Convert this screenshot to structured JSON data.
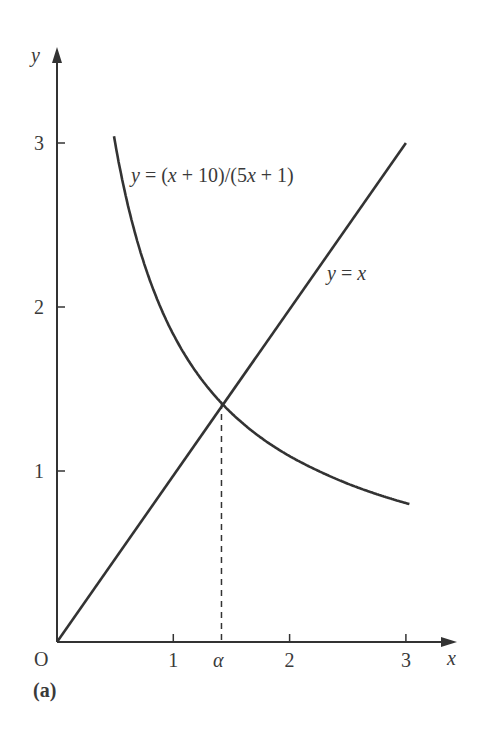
{
  "figure": {
    "panel_label": "(a)",
    "origin_label": "O",
    "x_axis_label": "x",
    "y_axis_label": "y",
    "alpha_label": "α",
    "curve_label": "y = (x + 10)/(5x + 1)",
    "line_label": "y = x"
  },
  "chart_data": {
    "type": "line",
    "title": "",
    "panel": "(a)",
    "xlabel": "x",
    "ylabel": "y",
    "xlim": [
      0,
      3.3
    ],
    "ylim": [
      0,
      3.4
    ],
    "x_ticks": [
      1,
      2,
      3
    ],
    "y_ticks": [
      1,
      2,
      3
    ],
    "grid": false,
    "legend": "none (curves labeled inline)",
    "series": [
      {
        "name": "y = (x + 10)/(5x + 1)",
        "function": "(x + 10)/(5x + 1)",
        "x": [
          0.49,
          0.6,
          0.8,
          1.0,
          1.2,
          1.414,
          1.6,
          1.8,
          2.0,
          2.2,
          2.4,
          2.6,
          2.8,
          3.0
        ],
        "values": [
          3.04,
          2.65,
          2.16,
          1.83,
          1.6,
          1.414,
          1.29,
          1.18,
          1.09,
          1.02,
          0.96,
          0.9,
          0.86,
          0.81
        ]
      },
      {
        "name": "y = x",
        "function": "x",
        "x": [
          0,
          3
        ],
        "values": [
          0,
          3
        ]
      }
    ],
    "annotations": [
      {
        "text": "α",
        "x": 1.414,
        "note": "intersection x = √2, dashed vertical line to x-axis"
      },
      {
        "text": "O",
        "x": 0,
        "y": 0,
        "note": "origin"
      },
      {
        "text": "(a)",
        "note": "panel label"
      }
    ]
  }
}
